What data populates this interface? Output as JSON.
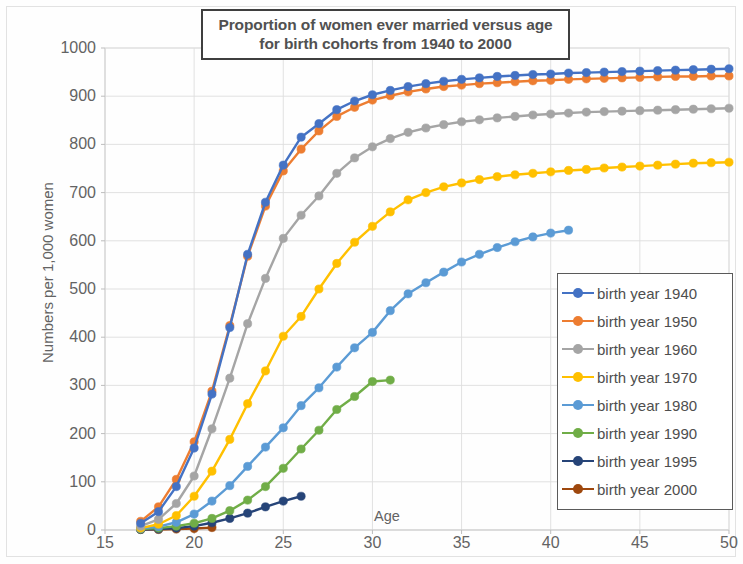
{
  "chart_data": {
    "type": "line",
    "title": "Proportion of women ever married versus age for birth cohorts from 1940 to 2000",
    "title_lines": [
      "Proportion of women ever married versus age",
      "for birth cohorts from 1940 to 2000"
    ],
    "xlabel": "Age",
    "ylabel": "Numbers per 1,000 women",
    "xlim": [
      15,
      50
    ],
    "ylim": [
      0,
      1000
    ],
    "xticks": [
      15,
      20,
      25,
      30,
      35,
      40,
      45,
      50
    ],
    "yticks": [
      0,
      100,
      200,
      300,
      400,
      500,
      600,
      700,
      800,
      900,
      1000
    ],
    "grid": true,
    "legend_position": "right-bottom",
    "markers": true,
    "series": [
      {
        "name": "birth year 1940",
        "color": "#4472C4",
        "x": [
          17,
          18,
          19,
          20,
          21,
          22,
          23,
          24,
          25,
          26,
          27,
          28,
          29,
          30,
          31,
          32,
          33,
          34,
          35,
          36,
          37,
          38,
          39,
          40,
          41,
          42,
          43,
          44,
          45,
          46,
          47,
          48,
          49,
          50
        ],
        "values": [
          14,
          38,
          90,
          170,
          282,
          420,
          572,
          680,
          757,
          815,
          843,
          872,
          890,
          903,
          912,
          920,
          926,
          931,
          935,
          938,
          941,
          943,
          945,
          946,
          948,
          949,
          950,
          951,
          952,
          953,
          954,
          955,
          956,
          957
        ]
      },
      {
        "name": "birth year 1950",
        "color": "#ED7D31",
        "x": [
          17,
          18,
          19,
          20,
          21,
          22,
          23,
          24,
          25,
          26,
          27,
          28,
          29,
          30,
          31,
          32,
          33,
          34,
          35,
          36,
          37,
          38,
          39,
          40,
          41,
          42,
          43,
          44,
          45,
          46,
          47,
          48,
          49,
          50
        ],
        "values": [
          18,
          48,
          105,
          183,
          288,
          424,
          568,
          672,
          745,
          790,
          828,
          858,
          877,
          892,
          901,
          909,
          915,
          920,
          923,
          926,
          928,
          930,
          932,
          933,
          935,
          936,
          937,
          938,
          939,
          940,
          941,
          941,
          942,
          942
        ]
      },
      {
        "name": "birth year 1960",
        "color": "#A5A5A5",
        "x": [
          17,
          18,
          19,
          20,
          21,
          22,
          23,
          24,
          25,
          26,
          27,
          28,
          29,
          30,
          31,
          32,
          33,
          34,
          35,
          36,
          37,
          38,
          39,
          40,
          41,
          42,
          43,
          44,
          45,
          46,
          47,
          48,
          49,
          50
        ],
        "values": [
          8,
          22,
          55,
          112,
          210,
          315,
          428,
          522,
          605,
          653,
          693,
          740,
          772,
          795,
          812,
          825,
          834,
          841,
          847,
          851,
          855,
          858,
          861,
          863,
          865,
          867,
          868,
          869,
          870,
          871,
          872,
          873,
          874,
          875
        ]
      },
      {
        "name": "birth year 1970",
        "color": "#FFC000",
        "x": [
          17,
          18,
          19,
          20,
          21,
          22,
          23,
          24,
          25,
          26,
          27,
          28,
          29,
          30,
          31,
          32,
          33,
          34,
          35,
          36,
          37,
          38,
          39,
          40,
          41,
          42,
          43,
          44,
          45,
          46,
          47,
          48,
          49,
          50
        ],
        "values": [
          4,
          12,
          30,
          70,
          122,
          188,
          262,
          330,
          402,
          443,
          500,
          553,
          597,
          630,
          660,
          685,
          700,
          712,
          720,
          727,
          733,
          737,
          740,
          743,
          746,
          748,
          751,
          753,
          755,
          757,
          759,
          761,
          762,
          763
        ]
      },
      {
        "name": "birth year 1980",
        "color": "#5B9BD5",
        "x": [
          17,
          18,
          19,
          20,
          21,
          22,
          23,
          24,
          25,
          26,
          27,
          28,
          29,
          30,
          31,
          32,
          33,
          34,
          35,
          36,
          37,
          38,
          39,
          40,
          41
        ],
        "values": [
          3,
          7,
          16,
          33,
          60,
          92,
          132,
          172,
          212,
          258,
          295,
          338,
          378,
          410,
          455,
          490,
          513,
          535,
          556,
          572,
          586,
          598,
          608,
          616,
          622
        ]
      },
      {
        "name": "birth year 1990",
        "color": "#70AD47",
        "x": [
          17,
          18,
          19,
          20,
          21,
          22,
          23,
          24,
          25,
          26,
          27,
          28,
          29,
          30,
          31
        ],
        "values": [
          2,
          4,
          8,
          14,
          24,
          40,
          62,
          90,
          128,
          168,
          207,
          250,
          277,
          308,
          311
        ]
      },
      {
        "name": "birth year 1995",
        "color": "#264478",
        "x": [
          17,
          18,
          19,
          20,
          21,
          22,
          23,
          24,
          25,
          26
        ],
        "values": [
          1,
          2,
          4,
          8,
          15,
          24,
          35,
          48,
          60,
          70
        ]
      },
      {
        "name": "birth year 2000",
        "color": "#9E480E",
        "x": [
          17,
          18,
          19,
          20,
          21
        ],
        "values": [
          1,
          1,
          2,
          3,
          5
        ]
      }
    ]
  }
}
